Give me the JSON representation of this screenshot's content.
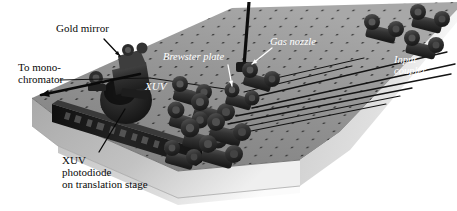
{
  "figure": {
    "type": "photograph",
    "background_color": "#ffffff"
  },
  "colors": {
    "table_top": "#8d8d8d",
    "table_top_far": "#a3a3a3",
    "table_side": "#b9b9b9",
    "table_side_lower": "#cfcfcf",
    "hole_dot": "#2a2a2a",
    "mount_dark": "#272727",
    "mount_mid": "#4a4a4a",
    "stage_block": "#1c1c1c",
    "beam_line": "#151515",
    "label_dark": "#0a0a0a",
    "label_light": "#ffffff"
  },
  "labels": [
    {
      "id": "gold-mirror",
      "text": "Gold mirror",
      "style": "dark",
      "lines": [
        "Gold mirror"
      ],
      "x": 56,
      "y": 23,
      "font_size": 11,
      "leader": {
        "from": [
          104,
          39
        ],
        "to": [
          120,
          56
        ],
        "color": "#0a0a0a",
        "arrow": true
      }
    },
    {
      "id": "to-monochromator",
      "text": "To mono-chromator",
      "style": "dark",
      "lines": [
        "To mono-",
        "chromator"
      ],
      "x": 18,
      "y": 62,
      "font_size": 11,
      "leader": {
        "from": [
          140,
          74
        ],
        "to": [
          41,
          95
        ],
        "color": "#0a0a0a",
        "arrow": true,
        "thick": true
      }
    },
    {
      "id": "brewster-plate",
      "text": "Brewster plate",
      "style": "light",
      "lines": [
        "Brewster plate"
      ],
      "x": 163,
      "y": 51,
      "font_size": 10.5,
      "leader": {
        "from": [
          228,
          65
        ],
        "to": [
          232,
          86
        ],
        "color": "#ffffff",
        "arrow": true
      }
    },
    {
      "id": "gas-nozzle",
      "text": "Gas nozzle",
      "style": "light",
      "lines": [
        "Gas nozzle"
      ],
      "x": 270,
      "y": 36,
      "font_size": 10.5,
      "leader": {
        "from": [
          272,
          48
        ],
        "to": [
          252,
          64
        ],
        "color": "#ffffff",
        "arrow": true
      }
    },
    {
      "id": "input-coupler",
      "text": "Input coupler",
      "style": "light",
      "lines": [
        "Input",
        "coupler"
      ],
      "x": 394,
      "y": 54,
      "font_size": 10.5,
      "leader": null
    },
    {
      "id": "xuv-beam",
      "text": "XUV",
      "style": "light",
      "lines": [
        "XUV"
      ],
      "x": 145,
      "y": 81,
      "font_size": 11,
      "leader": null
    },
    {
      "id": "xuv-photodiode",
      "text": "XUV photodiode on translation stage",
      "style": "dark",
      "lines": [
        "XUV",
        "photodiode",
        "on translation stage"
      ],
      "x": 62,
      "y": 155,
      "font_size": 11,
      "leader": {
        "from": [
          99,
          152
        ],
        "to": [
          125,
          109
        ],
        "color": "#0a0a0a",
        "arrow": false
      }
    }
  ],
  "scene_elements": [
    {
      "id": "optical-table",
      "name": "optical-breadboard-table"
    },
    {
      "id": "hole-grid",
      "name": "tapped-hole-grid"
    },
    {
      "id": "translation-stage",
      "name": "translation-stage-block"
    },
    {
      "id": "gold-mirror-mount",
      "name": "gold-mirror-mount"
    },
    {
      "id": "vacuum-port",
      "name": "dark-circular-port"
    },
    {
      "id": "mount-cluster",
      "name": "optics-mount-cluster"
    },
    {
      "id": "nozzle-rod",
      "name": "gas-nozzle-vertical-rod"
    },
    {
      "id": "beam-paths",
      "name": "laser-beam-paths"
    },
    {
      "id": "coupler-mounts",
      "name": "input-coupler-mounts"
    }
  ]
}
